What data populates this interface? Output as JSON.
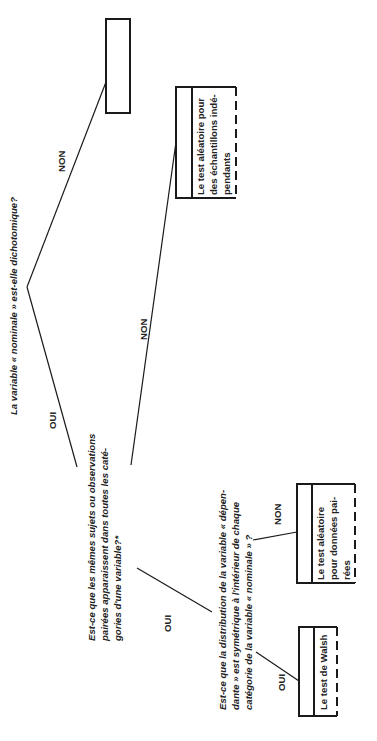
{
  "diagram": {
    "orientation": "rotated-90-ccw",
    "root_question": "La variable « nominale » est-elle dichotomique?",
    "branches": {
      "root_non": "NON",
      "root_oui": "OUI",
      "q2_non": "NON",
      "q2_oui": "OUI",
      "q3_non": "NON",
      "q3_oui": "OUI"
    },
    "question_2": [
      "Est-ce que les mêmes sujets ou observations",
      "pairées apparaissent dans toutes les caté-",
      "gories d'une variable?*"
    ],
    "question_3": [
      "Est-ce que la distribution de la variable « dépen-",
      "dante » est symétrique à l'intérieur de chaque",
      "catégorie de la variable « nominale » ?"
    ],
    "results": {
      "empty_box": "",
      "independent_samples": [
        "Le test aléatoire pour",
        "des échantillons indé-",
        "pendants"
      ],
      "paired_data": [
        "Le test aléatoire",
        "pour données pai-",
        "rées"
      ],
      "walsh": [
        "Le test de Walsh"
      ]
    }
  }
}
